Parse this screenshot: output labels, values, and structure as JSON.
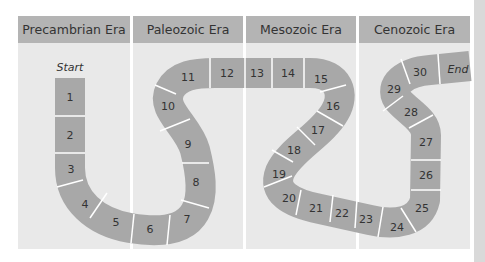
{
  "eras": [
    {
      "label": "Precambrian Era",
      "x": 18,
      "w": 112
    },
    {
      "label": "Paleozoic Era",
      "x": 133,
      "w": 110
    },
    {
      "label": "Mesozoic Era",
      "x": 246,
      "w": 110
    },
    {
      "label": "Cenozoic Era",
      "x": 359,
      "w": 111
    }
  ],
  "track": {
    "color": "#a8a8a8",
    "start_label": "Start",
    "end_label": "End",
    "spaces": [
      {
        "n": "1",
        "x": 70,
        "y": 97
      },
      {
        "n": "2",
        "x": 70,
        "y": 135
      },
      {
        "n": "3",
        "x": 71,
        "y": 169
      },
      {
        "n": "4",
        "x": 85,
        "y": 204
      },
      {
        "n": "5",
        "x": 116,
        "y": 222
      },
      {
        "n": "6",
        "x": 150,
        "y": 229
      },
      {
        "n": "7",
        "x": 187,
        "y": 219
      },
      {
        "n": "8",
        "x": 196,
        "y": 182
      },
      {
        "n": "9",
        "x": 188,
        "y": 144
      },
      {
        "n": "10",
        "x": 168,
        "y": 106
      },
      {
        "n": "11",
        "x": 188,
        "y": 77
      },
      {
        "n": "12",
        "x": 227,
        "y": 73
      },
      {
        "n": "13",
        "x": 257,
        "y": 73
      },
      {
        "n": "14",
        "x": 288,
        "y": 73
      },
      {
        "n": "15",
        "x": 321,
        "y": 79
      },
      {
        "n": "16",
        "x": 333,
        "y": 106
      },
      {
        "n": "17",
        "x": 318,
        "y": 130
      },
      {
        "n": "18",
        "x": 294,
        "y": 150
      },
      {
        "n": "19",
        "x": 279,
        "y": 174
      },
      {
        "n": "20",
        "x": 289,
        "y": 198
      },
      {
        "n": "21",
        "x": 316,
        "y": 208
      },
      {
        "n": "22",
        "x": 342,
        "y": 213
      },
      {
        "n": "23",
        "x": 366,
        "y": 219
      },
      {
        "n": "24",
        "x": 397,
        "y": 227
      },
      {
        "n": "25",
        "x": 422,
        "y": 208
      },
      {
        "n": "26",
        "x": 426,
        "y": 175
      },
      {
        "n": "27",
        "x": 426,
        "y": 142
      },
      {
        "n": "28",
        "x": 411,
        "y": 112
      },
      {
        "n": "29",
        "x": 394,
        "y": 89
      },
      {
        "n": "30",
        "x": 420,
        "y": 72
      }
    ]
  }
}
